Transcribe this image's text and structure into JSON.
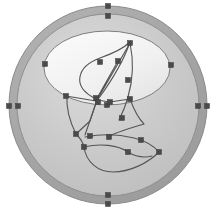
{
  "canvas": {
    "name": "vector-path-editor-canvas",
    "width": 216,
    "height": 211,
    "background_color": "#ffffff",
    "zoom_label": "100%"
  },
  "palette": {
    "ring_fill": "#a9a9a9",
    "ring_stroke": "#8a8a8a",
    "disc_fill": "#c9c9c9",
    "disc_stroke": "#8f8f8f",
    "ellipse_fill": "#efefef",
    "ellipse_stroke": "#7d7d7d",
    "path_stroke": "#555555",
    "handle_fill": "#4a4a4a",
    "handle_stroke": "#3a3a3a",
    "highlight": "#f4f4f4"
  },
  "shapes": [
    {
      "id": "outer-ring",
      "label": "Outer Ring",
      "type": "circle",
      "cx": 108,
      "cy": 105,
      "r": 99,
      "fill": "#a9a9a9",
      "stroke": "#8a8a8a",
      "stroke_width": 1
    },
    {
      "id": "inner-disc",
      "label": "Inner Disc",
      "type": "circle",
      "cx": 108,
      "cy": 105,
      "r": 91,
      "fill": "#c9c9c9",
      "stroke": "#8f8f8f",
      "stroke_width": 1
    },
    {
      "id": "upper-ellipse",
      "label": "Upper Ellipse",
      "type": "ellipse",
      "cx": 107,
      "cy": 68,
      "rx": 63,
      "ry": 37,
      "fill": "#efefef",
      "stroke": "#7d7d7d",
      "stroke_width": 1
    }
  ],
  "paths": [
    {
      "id": "leaf-path",
      "label": "Leaf Outline Path",
      "d": "M 96 99 C 70 86 78 66 100 58 C 114 53 124 48 130 42 C 124 60 112 80 99 98 Z",
      "stroke": "#555555",
      "stroke_width": 1.1,
      "fill": "none"
    },
    {
      "id": "spine-path",
      "label": "Leaf Spine Path",
      "d": "M 96 100 L 118 61 M 97 100 L 130 43",
      "stroke": "#555555",
      "stroke_width": 1.1,
      "fill": "none"
    },
    {
      "id": "right-stem-path",
      "label": "Right Stem Path",
      "d": "M 130 43 C 134 62 133 80 128 97 C 125 108 122 114 119 120",
      "stroke": "#555555",
      "stroke_width": 1.1,
      "fill": "none"
    },
    {
      "id": "v-fold-path",
      "label": "V Fold Path",
      "d": "M 67 95 C 66 108 70 122 76 134 L 90 121 L 97 100",
      "stroke": "#555555",
      "stroke_width": 1.1,
      "fill": "none"
    },
    {
      "id": "cross-brace-path",
      "label": "Cross Brace Path",
      "d": "M 97 100 L 85 135 M 96 101 L 66 96 M 97 100 L 110 102 M 110 102 L 130 99",
      "stroke": "#555555",
      "stroke_width": 1.1,
      "fill": "none"
    },
    {
      "id": "lower-arc-path",
      "label": "Lower Arc Path",
      "d": "M 130 99 C 134 110 138 118 144 124 C 131 128 114 133 108 137",
      "stroke": "#555555",
      "stroke_width": 1.1,
      "fill": "none"
    },
    {
      "id": "crescent-upper-path",
      "label": "Crescent Upper Path",
      "d": "M 85 137 C 100 134 118 134 134 138 C 146 141 154 146 159 152",
      "stroke": "#555555",
      "stroke_width": 1.1,
      "fill": "none"
    },
    {
      "id": "crescent-lower-path",
      "label": "Crescent Lower Path",
      "d": "M 84 147 C 86 162 98 172 113 172 C 130 172 148 163 159 152",
      "stroke": "#555555",
      "stroke_width": 1.1,
      "fill": "none"
    },
    {
      "id": "crescent-mid-path",
      "label": "Crescent Mid Path",
      "d": "M 84 147 C 100 143 118 145 128 152 C 136 157 144 158 152 156",
      "stroke": "#555555",
      "stroke_width": 1.1,
      "fill": "none"
    },
    {
      "id": "tail-path",
      "label": "Tail Path",
      "d": "M 76 134 C 80 138 83 142 84 147",
      "stroke": "#555555",
      "stroke_width": 1.1,
      "fill": "none"
    }
  ],
  "handles": [
    {
      "id": "h-top-outer",
      "label": "top-outer-anchor",
      "x": 108,
      "y": 6,
      "size": 5
    },
    {
      "id": "h-top-inner",
      "label": "top-inner-anchor",
      "x": 108,
      "y": 16,
      "size": 5
    },
    {
      "id": "h-left-outer",
      "label": "left-outer-anchor",
      "x": 9,
      "y": 106,
      "size": 5
    },
    {
      "id": "h-left-inner",
      "label": "left-inner-anchor",
      "x": 18,
      "y": 106,
      "size": 5
    },
    {
      "id": "h-right-outer",
      "label": "right-outer-anchor",
      "x": 207,
      "y": 106,
      "size": 5
    },
    {
      "id": "h-right-inner",
      "label": "right-inner-anchor",
      "x": 198,
      "y": 106,
      "size": 5
    },
    {
      "id": "h-bot-outer",
      "label": "bottom-outer-anchor",
      "x": 108,
      "y": 204,
      "size": 5
    },
    {
      "id": "h-bot-inner",
      "label": "bottom-inner-anchor",
      "x": 108,
      "y": 195,
      "size": 5
    },
    {
      "id": "h-ell-left",
      "label": "ellipse-left-anchor",
      "x": 45,
      "y": 64,
      "size": 5
    },
    {
      "id": "h-ell-right",
      "label": "ellipse-right-anchor",
      "x": 171,
      "y": 65,
      "size": 5
    },
    {
      "id": "h-ell-bottom",
      "label": "ellipse-bottom-anchor",
      "x": 107,
      "y": 105,
      "size": 5
    },
    {
      "id": "h-leaf-tip",
      "label": "leaf-tip-anchor",
      "x": 130,
      "y": 43,
      "size": 5
    },
    {
      "id": "h-leaf-upper",
      "label": "leaf-upper-anchor",
      "x": 118,
      "y": 61,
      "size": 5
    },
    {
      "id": "h-leaf-mid",
      "label": "leaf-mid-anchor",
      "x": 100,
      "y": 62,
      "size": 5
    },
    {
      "id": "h-leaf-left",
      "label": "leaf-left-anchor",
      "x": 66,
      "y": 96,
      "size": 5
    },
    {
      "id": "h-center-a",
      "label": "center-cluster-anchor-a",
      "x": 96,
      "y": 98,
      "size": 5
    },
    {
      "id": "h-center-b",
      "label": "center-cluster-anchor-b",
      "x": 98,
      "y": 102,
      "size": 5
    },
    {
      "id": "h-center-c",
      "label": "center-cluster-anchor-c",
      "x": 110,
      "y": 102,
      "size": 5
    },
    {
      "id": "h-stem-mid",
      "label": "stem-mid-anchor",
      "x": 128,
      "y": 80,
      "size": 5
    },
    {
      "id": "h-stem-low",
      "label": "stem-low-anchor",
      "x": 130,
      "y": 99,
      "size": 5
    },
    {
      "id": "h-stem-foot",
      "label": "stem-foot-anchor",
      "x": 122,
      "y": 118,
      "size": 5
    },
    {
      "id": "h-v-bottom",
      "label": "v-bottom-anchor",
      "x": 76,
      "y": 134,
      "size": 5
    },
    {
      "id": "h-v-right",
      "label": "v-right-anchor",
      "x": 90,
      "y": 136,
      "size": 5
    },
    {
      "id": "h-cres-left",
      "label": "crescent-left-anchor",
      "x": 84,
      "y": 147,
      "size": 5
    },
    {
      "id": "h-cres-top",
      "label": "crescent-top-anchor",
      "x": 109,
      "y": 137,
      "size": 5
    },
    {
      "id": "h-cres-right",
      "label": "crescent-right-anchor",
      "x": 141,
      "y": 140,
      "size": 5
    },
    {
      "id": "h-cres-tip",
      "label": "crescent-tip-anchor",
      "x": 159,
      "y": 152,
      "size": 5
    },
    {
      "id": "h-cres-mid",
      "label": "crescent-mid-anchor",
      "x": 128,
      "y": 152,
      "size": 5
    }
  ]
}
